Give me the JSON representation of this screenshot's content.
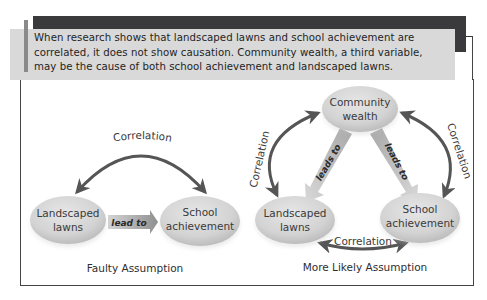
{
  "callout": {
    "lines": [
      "When research shows that landscaped lawns and school achievement are",
      "correlated, it does not show causation. Community wealth, a third variable,",
      "may be the cause of both school achievement and landscaped lawns."
    ]
  },
  "faulty": {
    "caption": "Faulty Assumption",
    "correlation_label": "Correlation",
    "arrow_label": "lead to",
    "nodes": {
      "left": {
        "line1": "Landscaped",
        "line2": "lawns"
      },
      "right": {
        "line1": "School",
        "line2": "achievement"
      }
    }
  },
  "likely": {
    "caption": "More Likely Assumption",
    "top_node": {
      "line1": "Community",
      "line2": "wealth"
    },
    "left_node": {
      "line1": "Landscaped",
      "line2": "lawns"
    },
    "right_node": {
      "line1": "School",
      "line2": "achievement"
    },
    "left_arc_label": "Correlation",
    "right_arc_label": "Correlation",
    "bottom_arc_label": "Correlation",
    "left_arrow_label": "leads to",
    "right_arrow_label": "leads to"
  },
  "colors": {
    "dark_bar": "#3a3a3c",
    "callout_bg": "#d9d9d9",
    "accent": "#8a8a8a",
    "node_fill": "#d6d6d6",
    "arrow": "#555555"
  }
}
